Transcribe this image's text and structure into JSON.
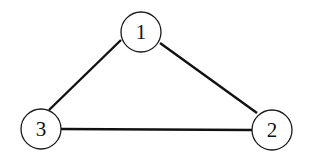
{
  "diagram": {
    "type": "undirected-graph",
    "nodes": [
      {
        "id": "1",
        "label": "1",
        "cx": 141,
        "cy": 32,
        "r": 20
      },
      {
        "id": "2",
        "label": "2",
        "cx": 272,
        "cy": 130,
        "r": 20
      },
      {
        "id": "3",
        "label": "3",
        "cx": 41,
        "cy": 129,
        "r": 20
      }
    ],
    "edges": [
      {
        "from": "1",
        "to": "2"
      },
      {
        "from": "1",
        "to": "3"
      },
      {
        "from": "3",
        "to": "2"
      }
    ],
    "colors": {
      "stroke": "#111111",
      "background": "#ffffff"
    }
  }
}
